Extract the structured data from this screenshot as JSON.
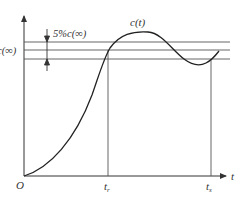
{
  "diagram": {
    "type": "step-response",
    "curve_label": "c(t)",
    "steady_state_label": "c(∞)",
    "tolerance_band_label": "5%c(∞)",
    "x_axis_label": "t",
    "origin_label": "O",
    "rise_time_label": {
      "base": "t",
      "sub": "r"
    },
    "settling_time_label": {
      "base": "t",
      "sub": "s"
    },
    "colors": {
      "line": "#333333",
      "guide": "#555555",
      "background": "#ffffff"
    }
  }
}
